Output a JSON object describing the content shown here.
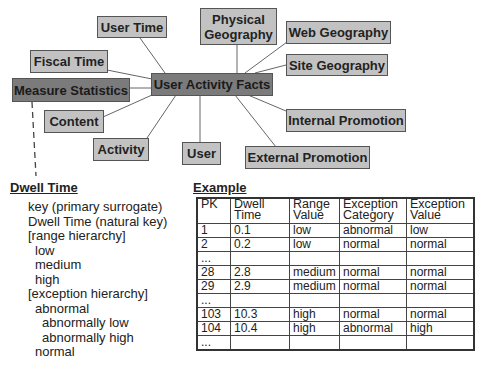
{
  "diagram": {
    "center": {
      "label": "User Activity Facts"
    },
    "nodes": [
      {
        "id": "user-time",
        "label": "User Time"
      },
      {
        "id": "physical-geography",
        "label": "Physical Geography"
      },
      {
        "id": "web-geography",
        "label": "Web Geography"
      },
      {
        "id": "site-geography",
        "label": "Site Geography"
      },
      {
        "id": "fiscal-time",
        "label": "Fiscal Time"
      },
      {
        "id": "measure-statistics",
        "label": "Measure Statistics"
      },
      {
        "id": "content",
        "label": "Content"
      },
      {
        "id": "activity",
        "label": "Activity"
      },
      {
        "id": "user",
        "label": "User"
      },
      {
        "id": "internal-promotion",
        "label": "Internal Promotion"
      },
      {
        "id": "external-promotion",
        "label": "External Promotion"
      }
    ],
    "colors": {
      "node_fill": "#c2c2c2",
      "center_fill": "#7b7b7b",
      "border": "#555555"
    }
  },
  "dwell_time": {
    "heading": "Dwell Time",
    "attributes": [
      {
        "text": "key (primary surrogate)",
        "indent": 0
      },
      {
        "text": "Dwell Time (natural key)",
        "indent": 0
      },
      {
        "text": "[range hierarchy]",
        "indent": 0
      },
      {
        "text": "low",
        "indent": 1
      },
      {
        "text": "medium",
        "indent": 1
      },
      {
        "text": "high",
        "indent": 1
      },
      {
        "text": "[exception hierarchy]",
        "indent": 0
      },
      {
        "text": "abnormal",
        "indent": 1
      },
      {
        "text": "abnormally low",
        "indent": 2
      },
      {
        "text": "abnormally high",
        "indent": 2
      },
      {
        "text": "normal",
        "indent": 1
      }
    ]
  },
  "example": {
    "heading": "Example",
    "columns": [
      "PK",
      "Dwell Time",
      "Range Value",
      "Exception Category",
      "Exception Value"
    ],
    "rows": [
      [
        "1",
        "0.1",
        "low",
        "abnormal",
        "low"
      ],
      [
        "2",
        "0.2",
        "low",
        "normal",
        "normal"
      ],
      [
        "...",
        "",
        "",
        "",
        ""
      ],
      [
        "28",
        "2.8",
        "medium",
        "normal",
        "normal"
      ],
      [
        "29",
        "2.9",
        "medium",
        "normal",
        "normal"
      ],
      [
        "...",
        "",
        "",
        "",
        ""
      ],
      [
        "103",
        "10.3",
        "high",
        "normal",
        "normal"
      ],
      [
        "104",
        "10.4",
        "high",
        "abnormal",
        "high"
      ],
      [
        "...",
        "",
        "",
        "",
        ""
      ]
    ]
  }
}
